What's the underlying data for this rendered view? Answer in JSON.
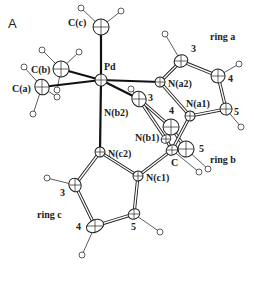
{
  "figure": {
    "panel_label": "A",
    "atoms": [
      {
        "id": "Pd",
        "label": "Pd",
        "x": 101,
        "y": 80,
        "rx": 6,
        "ry": 6,
        "lx": 104,
        "ly": 70
      },
      {
        "id": "Cc",
        "label": "C(c)",
        "x": 101,
        "y": 27,
        "rx": 8,
        "ry": 8,
        "lx": 68,
        "ly": 26
      },
      {
        "id": "Cb",
        "label": "C(b)",
        "x": 61,
        "y": 69,
        "rx": 8,
        "ry": 8,
        "lx": 31,
        "ly": 73
      },
      {
        "id": "Ca",
        "label": "C(a)",
        "x": 42,
        "y": 87,
        "rx": 7,
        "ry": 8,
        "lx": 12,
        "ly": 92
      },
      {
        "id": "Na2",
        "label": "N(a2)",
        "x": 160,
        "y": 82,
        "rx": 5,
        "ry": 5,
        "lx": 168,
        "ly": 87
      },
      {
        "id": "a3",
        "label": "3",
        "x": 181,
        "y": 61,
        "rx": 7,
        "ry": 6,
        "lx": 191,
        "ly": 52
      },
      {
        "id": "a4",
        "label": "4",
        "x": 218,
        "y": 76,
        "rx": 7,
        "ry": 7,
        "lx": 228,
        "ly": 82
      },
      {
        "id": "a5",
        "label": "5",
        "x": 226,
        "y": 109,
        "rx": 6,
        "ry": 6,
        "lx": 234,
        "ly": 115
      },
      {
        "id": "Na1",
        "label": "N(a1)",
        "x": 190,
        "y": 116,
        "rx": 5,
        "ry": 5,
        "lx": 186,
        "ly": 107
      },
      {
        "id": "b3",
        "label": "3",
        "x": 139,
        "y": 99,
        "rx": 7,
        "ry": 8,
        "lx": 148,
        "ly": 101
      },
      {
        "id": "Nb2",
        "label": "N(b2)",
        "x": 101,
        "y": 80,
        "rx": 0,
        "ry": 0,
        "lx": 104,
        "ly": 116
      },
      {
        "id": "b4",
        "label": "4",
        "x": 171,
        "y": 127,
        "rx": 8,
        "ry": 8,
        "lx": 169,
        "ly": 114
      },
      {
        "id": "Nb1",
        "label": "N(b1)",
        "x": 166,
        "y": 139,
        "rx": 5,
        "ry": 4,
        "lx": 135,
        "ly": 141
      },
      {
        "id": "Cm",
        "label": "C",
        "x": 172,
        "y": 150,
        "rx": 6,
        "ry": 5,
        "lx": 171,
        "ly": 166
      },
      {
        "id": "b5",
        "label": "5",
        "x": 186,
        "y": 149,
        "rx": 8,
        "ry": 8,
        "lx": 199,
        "ly": 152
      },
      {
        "id": "Nc2",
        "label": "N(c2)",
        "x": 100,
        "y": 152,
        "rx": 5,
        "ry": 5,
        "lx": 108,
        "ly": 157
      },
      {
        "id": "Nc1",
        "label": "N(c1)",
        "x": 138,
        "y": 176,
        "rx": 5,
        "ry": 5,
        "lx": 146,
        "ly": 181
      },
      {
        "id": "c5",
        "label": "5",
        "x": 134,
        "y": 214,
        "rx": 6,
        "ry": 5,
        "lx": 131,
        "ly": 230
      },
      {
        "id": "c4",
        "label": "4",
        "x": 95,
        "y": 226,
        "rx": 9,
        "ry": 6,
        "lx": 76,
        "ly": 230
      },
      {
        "id": "c3",
        "label": "3",
        "x": 75,
        "y": 185,
        "rx": 6,
        "ry": 7,
        "lx": 60,
        "ly": 196
      }
    ],
    "ring_labels": [
      {
        "text": "ring a",
        "x": 210,
        "y": 40
      },
      {
        "text": "ring b",
        "x": 210,
        "y": 163
      },
      {
        "text": "ring c",
        "x": 37,
        "y": 218
      }
    ]
  }
}
